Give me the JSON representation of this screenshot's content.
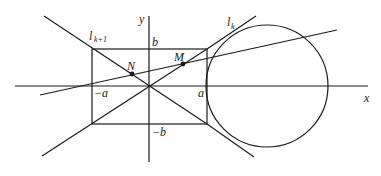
{
  "diagram": {
    "type": "geometry",
    "axes": {
      "x_label": "x",
      "y_label": "y"
    },
    "rectangle_labels": {
      "top": "b",
      "bottom": "−b",
      "left": "−a",
      "right": "a"
    },
    "lines": {
      "upper_left_line": "l",
      "upper_left_line_sub": "k+1",
      "tangent_line": "l",
      "tangent_line_sub": "k"
    },
    "points": {
      "N": "N",
      "M": "M"
    },
    "colors": {
      "stroke": "#1a1a1a",
      "background": "#ffffff"
    }
  }
}
